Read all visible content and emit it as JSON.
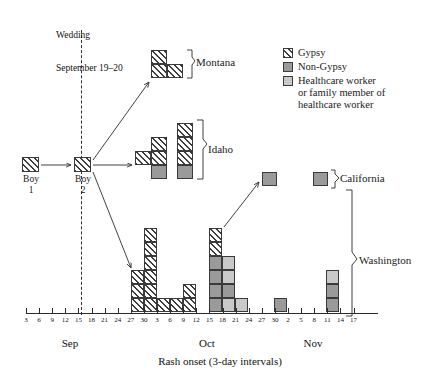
{
  "chart_data": {
    "type": "bar",
    "title": "",
    "xlabel": "Rash onset (3-day intervals)",
    "ylabel": "",
    "grid": false,
    "legend_position": "top-right",
    "annotations": {
      "wedding": "Wedding\nSeptember 19–20",
      "boy1": "Boy\n1",
      "boy2": "Boy\n2"
    },
    "categories": [
      "3",
      "6",
      "9",
      "12",
      "15",
      "18",
      "21",
      "24",
      "27",
      "30",
      "3",
      "6",
      "9",
      "12",
      "15",
      "18",
      "21",
      "24",
      "27",
      "30",
      "2",
      "5",
      "8",
      "11",
      "14",
      "17"
    ],
    "months": [
      {
        "label": "Sep",
        "start_index": 0,
        "end_index": 9
      },
      {
        "label": "Oct",
        "start_index": 10,
        "end_index": 19
      },
      {
        "label": "Nov",
        "start_index": 20,
        "end_index": 25
      }
    ],
    "series": [
      {
        "name": "Gypsy",
        "color": "#ffffff",
        "pattern": "diagonal-hatch"
      },
      {
        "name": "Non-Gypsy",
        "color": "#9a9a9a",
        "pattern": "solid"
      },
      {
        "name": "Healthcare worker or family member of healthcare worker",
        "color": "#c9c9c9",
        "pattern": "solid"
      }
    ],
    "groups": [
      {
        "name": "Montana",
        "bars": [
          {
            "category_index": 10,
            "gypsy": 2,
            "non_gypsy": 0,
            "hcw": 0
          },
          {
            "category_index": 11,
            "gypsy": 1,
            "non_gypsy": 0,
            "hcw": 0
          }
        ]
      },
      {
        "name": "Idaho",
        "bars": [
          {
            "category_index": 10,
            "gypsy": 1,
            "non_gypsy": 0,
            "hcw": 0
          },
          {
            "category_index": 11,
            "gypsy": 2,
            "non_gypsy": 1,
            "hcw": 0
          },
          {
            "category_index": 13,
            "gypsy": 3,
            "non_gypsy": 1,
            "hcw": 0
          }
        ]
      },
      {
        "name": "California",
        "bars": [
          {
            "category_index": 19,
            "gypsy": 0,
            "non_gypsy": 1,
            "hcw": 0
          }
        ]
      },
      {
        "name": "Washington",
        "bars": [
          {
            "category_index": 9,
            "gypsy": 3,
            "non_gypsy": 0,
            "hcw": 0
          },
          {
            "category_index": 10,
            "gypsy": 7,
            "non_gypsy": 0,
            "hcw": 0
          },
          {
            "category_index": 11,
            "gypsy": 1,
            "non_gypsy": 0,
            "hcw": 0
          },
          {
            "category_index": 12,
            "gypsy": 1,
            "non_gypsy": 0,
            "hcw": 0
          },
          {
            "category_index": 13,
            "gypsy": 2,
            "non_gypsy": 0,
            "hcw": 0
          },
          {
            "category_index": 14,
            "gypsy": 2,
            "non_gypsy": 3,
            "hcw": 1
          },
          {
            "category_index": 15,
            "gypsy": 0,
            "non_gypsy": 1,
            "hcw": 3
          },
          {
            "category_index": 16,
            "gypsy": 0,
            "non_gypsy": 0,
            "hcw": 1
          },
          {
            "category_index": 19,
            "gypsy": 0,
            "non_gypsy": 1,
            "hcw": 0
          },
          {
            "category_index": 24,
            "gypsy": 0,
            "non_gypsy": 2,
            "hcw": 1
          }
        ]
      }
    ]
  },
  "axis": {
    "xlabel": "Rash onset (3-day intervals)",
    "ticks": [
      "3",
      "6",
      "9",
      "12",
      "15",
      "18",
      "21",
      "24",
      "27",
      "30",
      "3",
      "6",
      "9",
      "12",
      "15",
      "18",
      "21",
      "24",
      "27",
      "30",
      "2",
      "5",
      "8",
      "11",
      "14",
      "17"
    ],
    "month_sep": "Sep",
    "month_oct": "Oct",
    "month_nov": "Nov"
  },
  "legend": {
    "items": [
      {
        "label": "Gypsy",
        "swatch": "gypsy"
      },
      {
        "label": "Non-Gypsy",
        "swatch": "nongypsy"
      },
      {
        "label": "Healthcare worker",
        "swatch": "hcw"
      },
      {
        "label": "or family member of",
        "swatch": "none"
      },
      {
        "label": "healthcare worker",
        "swatch": "none"
      }
    ]
  },
  "annotations": {
    "wedding_line1": "Wedding",
    "wedding_line2": "September 19–20",
    "boy1_line1": "Boy",
    "boy1_line2": "1",
    "boy2_line1": "Boy",
    "boy2_line2": "2"
  },
  "group_labels": {
    "montana": "Montana",
    "idaho": "Idaho",
    "california": "California",
    "washington": "Washington"
  },
  "colors": {
    "gypsy": "#ffffff",
    "non_gypsy": "#9a9a9a",
    "hcw": "#c9c9c9",
    "ink": "#2b2b2b"
  }
}
